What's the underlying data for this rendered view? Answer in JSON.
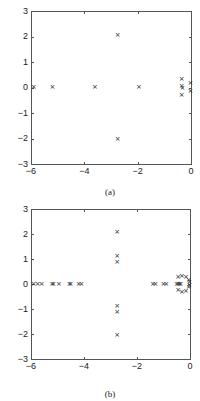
{
  "chart_data": [
    {
      "type": "scatter",
      "title": "",
      "caption": "(a)",
      "xlabel": "",
      "ylabel": "",
      "xlim": [
        -6,
        0
      ],
      "ylim": [
        -3,
        3
      ],
      "xticks": [
        "-6",
        "-4",
        "-2",
        "0"
      ],
      "yticks": [
        "3",
        "2",
        "1",
        "0",
        "-1",
        "-2",
        "-3"
      ],
      "grid": false,
      "marker": "x",
      "points": [
        {
          "x": -5.9,
          "y": 0
        },
        {
          "x": -5.2,
          "y": 0
        },
        {
          "x": -3.6,
          "y": 0
        },
        {
          "x": -2.75,
          "y": 2.05
        },
        {
          "x": -2.75,
          "y": -2.05
        },
        {
          "x": -1.95,
          "y": 0
        },
        {
          "x": -0.35,
          "y": 0.3
        },
        {
          "x": -0.35,
          "y": 0.02
        },
        {
          "x": -0.32,
          "y": -0.02
        },
        {
          "x": -0.35,
          "y": -0.3
        },
        {
          "x": -0.02,
          "y": 0.15
        },
        {
          "x": -0.02,
          "y": -0.15
        }
      ]
    },
    {
      "type": "scatter",
      "title": "",
      "caption": "(b)",
      "xlabel": "",
      "ylabel": "",
      "xlim": [
        -6,
        0
      ],
      "ylim": [
        -3,
        3
      ],
      "xticks": [
        "-6",
        "-4",
        "-2",
        "0"
      ],
      "yticks": [
        "3",
        "2",
        "1",
        "0",
        "-1",
        "-2",
        "-3"
      ],
      "grid": false,
      "marker": "x",
      "points": [
        {
          "x": -5.9,
          "y": 0
        },
        {
          "x": -5.75,
          "y": 0
        },
        {
          "x": -5.6,
          "y": 0
        },
        {
          "x": -5.2,
          "y": 0
        },
        {
          "x": -5.15,
          "y": 0
        },
        {
          "x": -4.95,
          "y": 0
        },
        {
          "x": -4.55,
          "y": 0
        },
        {
          "x": -4.5,
          "y": 0
        },
        {
          "x": -4.2,
          "y": 0
        },
        {
          "x": -4.1,
          "y": 0
        },
        {
          "x": -2.75,
          "y": 2.05
        },
        {
          "x": -2.75,
          "y": 1.1
        },
        {
          "x": -2.75,
          "y": 0.88
        },
        {
          "x": -2.75,
          "y": -0.9
        },
        {
          "x": -2.75,
          "y": -1.15
        },
        {
          "x": -2.75,
          "y": -2.05
        },
        {
          "x": -1.4,
          "y": 0
        },
        {
          "x": -1.3,
          "y": 0
        },
        {
          "x": -1.0,
          "y": 0
        },
        {
          "x": -0.9,
          "y": 0
        },
        {
          "x": -0.5,
          "y": 0
        },
        {
          "x": -0.45,
          "y": 0
        },
        {
          "x": -0.4,
          "y": 0
        },
        {
          "x": -0.35,
          "y": 0
        },
        {
          "x": -0.45,
          "y": 0.25
        },
        {
          "x": -0.3,
          "y": 0.32
        },
        {
          "x": -0.15,
          "y": 0.28
        },
        {
          "x": -0.05,
          "y": 0.15
        },
        {
          "x": -0.02,
          "y": 0.05
        },
        {
          "x": -0.45,
          "y": -0.25
        },
        {
          "x": -0.3,
          "y": -0.32
        },
        {
          "x": -0.15,
          "y": -0.28
        },
        {
          "x": -0.05,
          "y": -0.15
        },
        {
          "x": -0.02,
          "y": -0.05
        }
      ]
    }
  ],
  "panels": [
    {
      "caption": "(a)",
      "frame": {
        "left": 31,
        "top": 11,
        "right": 191,
        "bottom": 164
      },
      "caption_y": 187
    },
    {
      "caption": "(b)",
      "frame": {
        "left": 31,
        "top": 209,
        "right": 190,
        "bottom": 359
      },
      "caption_y": 389
    }
  ],
  "marker_glyph": "×"
}
